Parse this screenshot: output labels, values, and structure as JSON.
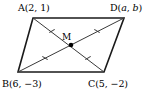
{
  "figure": {
    "type": "geometry-diagram",
    "shape": "parallelogram",
    "title": "",
    "stroke_color": "#1a1a1a",
    "diagonal_color": "#3a3a3a",
    "background_color": "#ffffff",
    "point_color": "#000000"
  },
  "vertices": {
    "A": {
      "label_name": "A",
      "label_full": "A(2, 1)",
      "coord_x": "2",
      "coord_y": "1",
      "px": 33,
      "py": 18
    },
    "D": {
      "label_name": "D",
      "label_full": "D(a, b)",
      "coord_x": "a",
      "coord_y": "b",
      "px": 124,
      "py": 18
    },
    "B": {
      "label_name": "B",
      "label_full": "B(6, −3)",
      "coord_x": "6",
      "coord_y": "−3",
      "px": 18,
      "py": 72
    },
    "C": {
      "label_name": "C",
      "label_full": "C(5, −2)",
      "coord_x": "5",
      "coord_y": "−2",
      "px": 104,
      "py": 72
    }
  },
  "midpoint": {
    "label": "M",
    "px": 71,
    "py": 45,
    "dot_radius": 2.3
  },
  "edges": [
    {
      "name": "AB",
      "from": "A",
      "to": "B"
    },
    {
      "name": "BC",
      "from": "B",
      "to": "C"
    },
    {
      "name": "CD",
      "from": "C",
      "to": "D"
    },
    {
      "name": "DA",
      "from": "D",
      "to": "A"
    }
  ],
  "diagonals": [
    {
      "name": "AC",
      "from": "A",
      "to": "C"
    },
    {
      "name": "BD",
      "from": "B",
      "to": "D"
    }
  ],
  "tick_marks": [
    {
      "name": "tick-MA",
      "segment": "MA",
      "px": 52,
      "py": 31,
      "angle": 58,
      "count": 1
    },
    {
      "name": "tick-MC",
      "segment": "MC",
      "px": 88,
      "py": 58,
      "angle": 58,
      "count": 1
    },
    {
      "name": "tick-MB",
      "segment": "MB",
      "px": 45,
      "py": 58,
      "angle": -58,
      "count": 1
    },
    {
      "name": "tick-MD",
      "segment": "MD",
      "px": 97,
      "py": 31,
      "angle": -58,
      "count": 1
    }
  ]
}
